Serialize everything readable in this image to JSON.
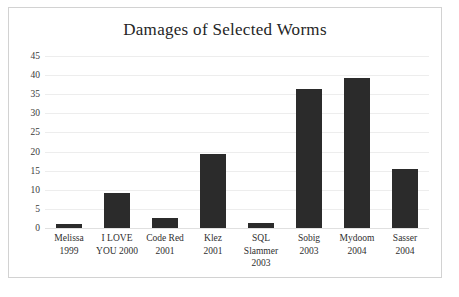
{
  "chart_data": {
    "type": "bar",
    "title": "Damages of Selected Worms",
    "xlabel": "",
    "ylabel": "",
    "ylim": [
      0,
      45
    ],
    "yticks": [
      0,
      5,
      10,
      15,
      20,
      25,
      30,
      35,
      40,
      45
    ],
    "grid": true,
    "legend": false,
    "bar_color": "#2b2b2b",
    "gridline_color": "#ededed",
    "categories": [
      "Melissa 1999",
      "I LOVE YOU 2000",
      "Code Red 2001",
      "Klez 2001",
      "SQL Slammer 2003",
      "Sobig 2003",
      "Mydoom 2004",
      "Sasser 2004"
    ],
    "category_lines": [
      [
        "Melissa",
        "1999"
      ],
      [
        "I LOVE",
        "YOU 2000"
      ],
      [
        "Code Red",
        "2001"
      ],
      [
        "Klez",
        "2001"
      ],
      [
        "SQL",
        "Slammer",
        "2003"
      ],
      [
        "Sobig",
        "2003"
      ],
      [
        "Mydoom",
        "2004"
      ],
      [
        "Sasser",
        "2004"
      ]
    ],
    "values": [
      1.0,
      9.1,
      2.6,
      19.3,
      1.3,
      36.5,
      39.2,
      15.5
    ]
  },
  "artifact": {
    "text": ""
  }
}
